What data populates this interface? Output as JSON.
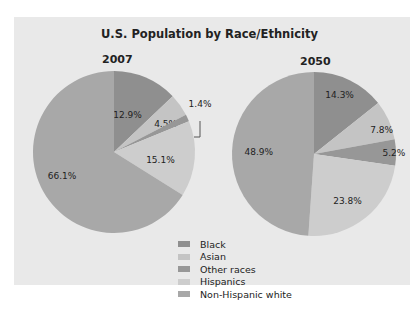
{
  "chart_data": [
    {
      "type": "pie",
      "title": "U.S. Population by Race/Ethnicity",
      "subtitle": "2007",
      "categories": [
        "Black",
        "Asian",
        "Other races",
        "Hispanics",
        "Non-Hispanic white"
      ],
      "values": [
        12.9,
        4.5,
        1.4,
        15.1,
        66.1
      ],
      "labels": [
        "12.9%",
        "4.5%",
        "1.4%",
        "15.1%",
        "66.1%"
      ]
    },
    {
      "type": "pie",
      "title": "U.S. Population by Race/Ethnicity",
      "subtitle": "2050",
      "categories": [
        "Black",
        "Asian",
        "Other races",
        "Hispanics",
        "Non-Hispanic white"
      ],
      "values": [
        14.3,
        7.8,
        5.2,
        23.8,
        48.9
      ],
      "labels": [
        "14.3%",
        "7.8%",
        "5.2%",
        "23.8%",
        "48.9%"
      ]
    }
  ],
  "title": "U.S. Population by Race/Ethnicity",
  "pies": [
    {
      "year": "2007",
      "cx": 114,
      "cy": 152,
      "r": 81,
      "values": [
        12.9,
        4.5,
        1.4,
        15.1,
        66.1
      ],
      "labels": [
        "12.9%",
        "4.5%",
        "1.4%",
        "15.1%",
        "66.1%"
      ]
    },
    {
      "year": "2050",
      "cx": 314,
      "cy": 154,
      "r": 82,
      "values": [
        14.3,
        7.8,
        5.2,
        23.8,
        48.9
      ],
      "labels": [
        "14.3%",
        "7.8%",
        "5.2%",
        "23.8%",
        "48.9%"
      ]
    }
  ],
  "legend": [
    {
      "label": "Black",
      "color": "#8f8f8f"
    },
    {
      "label": "Asian",
      "color": "#c4c4c4"
    },
    {
      "label": "Other races",
      "color": "#979797"
    },
    {
      "label": "Hispanics",
      "color": "#cdcdcd"
    },
    {
      "label": "Non-Hispanic white",
      "color": "#a8a8a8"
    }
  ]
}
